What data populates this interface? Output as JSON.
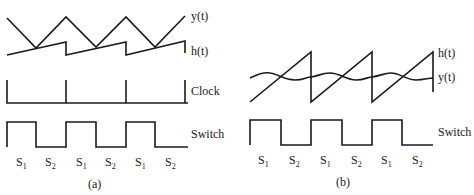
{
  "panels": [
    {
      "id": "a",
      "caption": "(a)",
      "signals": {
        "y": {
          "label": "y(t)"
        },
        "h": {
          "label": "h(t)"
        },
        "clock": {
          "label": "Clock"
        },
        "switch": {
          "label": "Switch"
        }
      },
      "phases": [
        {
          "base": "S",
          "sub": "1"
        },
        {
          "base": "S",
          "sub": "2"
        },
        {
          "base": "S",
          "sub": "1"
        },
        {
          "base": "S",
          "sub": "2"
        },
        {
          "base": "S",
          "sub": "1"
        },
        {
          "base": "S",
          "sub": "2"
        }
      ]
    },
    {
      "id": "b",
      "caption": "(b)",
      "signals": {
        "h": {
          "label": "h(t)"
        },
        "y": {
          "label": "y(t)"
        },
        "switch": {
          "label": "Switch"
        }
      },
      "phases": [
        {
          "base": "S",
          "sub": "1"
        },
        {
          "base": "S",
          "sub": "2"
        },
        {
          "base": "S",
          "sub": "1"
        },
        {
          "base": "S",
          "sub": "2"
        },
        {
          "base": "S",
          "sub": "1"
        },
        {
          "base": "S",
          "sub": "2"
        }
      ]
    }
  ]
}
